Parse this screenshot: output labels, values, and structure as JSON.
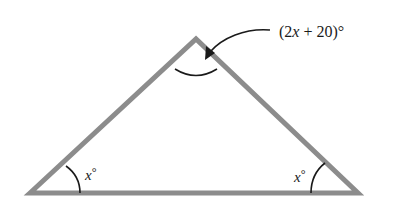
{
  "diagram": {
    "type": "triangle",
    "vertices": {
      "apex": [
        196,
        39
      ],
      "bottom_left": [
        30,
        193
      ],
      "bottom_right": [
        358,
        193
      ]
    },
    "edge_color": "#8c8c8c",
    "arc_color": "#1a1a1a",
    "labels": {
      "apex_angle": {
        "open": "(2",
        "var": "x",
        "rest": " + 20)°",
        "full": "(2x + 20)°"
      },
      "left_angle": {
        "var": "x",
        "deg": "°",
        "full": "x°"
      },
      "right_angle": {
        "var": "x",
        "deg": "°",
        "full": "x°"
      }
    }
  }
}
